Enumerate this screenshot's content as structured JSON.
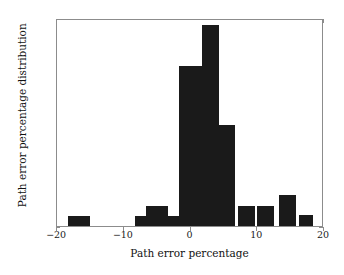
{
  "chart_data": {
    "type": "bar",
    "title": "",
    "xlabel": "Path error percentage",
    "ylabel": "Path error percentage distribution",
    "xlim": [
      -20,
      20
    ],
    "ylim": [
      0,
      0.35
    ],
    "grid": false,
    "legend": null,
    "bar_color": "#1a1a1a",
    "bin_width": 3.33,
    "xticks": [
      -20,
      -10,
      0,
      10,
      20
    ],
    "xtick_labels": [
      "−20",
      "−10",
      "0",
      "10",
      "20"
    ],
    "yticks": [
      0,
      0.05,
      0.1,
      0.15,
      0.2,
      0.25,
      0.3,
      0.35
    ],
    "ytick_labels": [
      "0",
      "0.05",
      "0.1",
      "0.15",
      "0.2",
      "0.25",
      "0.3",
      "0.35"
    ],
    "bins": [
      {
        "left": -18.3,
        "right": -15.0,
        "center": -16.7,
        "value": 0.017
      },
      {
        "left": -8.3,
        "right": -5.0,
        "center": -6.7,
        "value": 0.017
      },
      {
        "left": -6.7,
        "right": -3.3,
        "center": -5.0,
        "value": 0.034
      },
      {
        "left": -3.3,
        "right": -1.7,
        "center": -2.5,
        "value": 0.017
      },
      {
        "left": -1.7,
        "right": 1.7,
        "center": 0.0,
        "value": 0.27
      },
      {
        "left": 1.7,
        "right": 4.2,
        "center": 2.9,
        "value": 0.338
      },
      {
        "left": 4.2,
        "right": 6.7,
        "center": 5.4,
        "value": 0.17
      },
      {
        "left": 7.1,
        "right": 9.6,
        "center": 8.3,
        "value": 0.034
      },
      {
        "left": 10.0,
        "right": 12.5,
        "center": 11.2,
        "value": 0.034
      },
      {
        "left": 13.3,
        "right": 15.8,
        "center": 14.6,
        "value": 0.052
      },
      {
        "left": 16.2,
        "right": 18.3,
        "center": 17.2,
        "value": 0.018
      }
    ],
    "categories": [
      "-16.7",
      "-6.7",
      "-5.0",
      "-2.5",
      "0.0",
      "2.9",
      "5.4",
      "8.3",
      "11.2",
      "14.6",
      "17.2"
    ],
    "values": [
      0.017,
      0.017,
      0.034,
      0.017,
      0.27,
      0.338,
      0.17,
      0.034,
      0.034,
      0.052,
      0.018
    ]
  }
}
